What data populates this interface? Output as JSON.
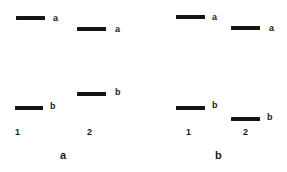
{
  "panels": [
    {
      "caption": "a",
      "lanes": [
        "1",
        "2"
      ],
      "bands": [
        {
          "lane": "1",
          "label": "a",
          "x": 16,
          "y": 16,
          "w": 29,
          "lx": 53,
          "ly": 14
        },
        {
          "lane": "2",
          "label": "a",
          "x": 77,
          "y": 27,
          "w": 29,
          "lx": 115,
          "ly": 25
        },
        {
          "lane": "1",
          "label": "b",
          "x": 15,
          "y": 106,
          "w": 28,
          "lx": 50,
          "ly": 102
        },
        {
          "lane": "2",
          "label": "b",
          "x": 77,
          "y": 92,
          "w": 29,
          "lx": 115,
          "ly": 88
        }
      ]
    },
    {
      "caption": "b",
      "lanes": [
        "1",
        "2"
      ],
      "bands": [
        {
          "lane": "1",
          "label": "a",
          "x": 176,
          "y": 15,
          "w": 29,
          "lx": 212,
          "ly": 13
        },
        {
          "lane": "2",
          "label": "a",
          "x": 231,
          "y": 26,
          "w": 29,
          "lx": 269,
          "ly": 24
        },
        {
          "lane": "1",
          "label": "b",
          "x": 176,
          "y": 106,
          "w": 29,
          "lx": 212,
          "ly": 101
        },
        {
          "lane": "2",
          "label": "b",
          "x": 231,
          "y": 117,
          "w": 29,
          "lx": 267,
          "ly": 113
        }
      ]
    }
  ],
  "labels": {
    "p0_b0": "a",
    "p0_b1": "a",
    "p0_b2": "b",
    "p0_b3": "b",
    "p1_b0": "a",
    "p1_b1": "a",
    "p1_b2": "b",
    "p1_b3": "b",
    "p0_lane1": "1",
    "p0_lane2": "2",
    "p1_lane1": "1",
    "p1_lane2": "2",
    "p0_caption": "a",
    "p1_caption": "b"
  }
}
